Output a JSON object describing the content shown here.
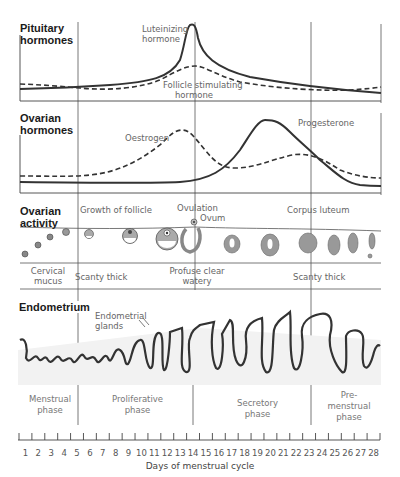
{
  "diagram": {
    "sections": {
      "pituitary": {
        "title_line1": "Pituitary",
        "title_line2": "hormones",
        "curves": [
          {
            "name": "Luteinizing hormone",
            "label_line1": "Luteinizing",
            "label_line2": "hormone",
            "style": "solid"
          },
          {
            "name": "Follicle stimulating hormone",
            "label_line1": "Follicle stimulating",
            "label_line2": "hormone",
            "style": "dashed"
          }
        ]
      },
      "ovarian_hormones": {
        "title_line1": "Ovarian",
        "title_line2": "hormones",
        "curves": [
          {
            "name": "Oestrogen",
            "label": "Oestrogen",
            "style": "dashed"
          },
          {
            "name": "Progesterone",
            "label": "Progesterone",
            "style": "solid"
          }
        ]
      },
      "ovarian_activity": {
        "title_line1": "Ovarian",
        "title_line2": "activity",
        "labels": {
          "growth": "Growth of follicle",
          "ovulation": "Ovulation",
          "ovum": "Ovum",
          "corpus_luteum": "Corpus luteum"
        },
        "cervical_mucus": {
          "label_line1": "Cervical",
          "label_line2": "mucus",
          "early": "Scanty thick",
          "mid_line1": "Profuse clear",
          "mid_line2": "watery",
          "late": "Scanty thick"
        }
      },
      "endometrium": {
        "title": "Endometrium",
        "glands_line1": "Endometrial",
        "glands_line2": "glands"
      }
    },
    "phases": [
      {
        "line1": "Menstrual",
        "line2": "phase",
        "line3": ""
      },
      {
        "line1": "Proliferative",
        "line2": "phase",
        "line3": ""
      },
      {
        "line1": "Secretory",
        "line2": "phase",
        "line3": ""
      },
      {
        "line1": "Pre-",
        "line2": "menstrual",
        "line3": "phase"
      }
    ],
    "axis": {
      "title": "Days of menstrual cycle",
      "days": [
        "1",
        "2",
        "3",
        "4",
        "5",
        "6",
        "7",
        "8",
        "9",
        "10",
        "11",
        "12",
        "13",
        "14",
        "15",
        "16",
        "17",
        "18",
        "19",
        "20",
        "21",
        "22",
        "23",
        "24",
        "25",
        "26",
        "27",
        "28"
      ]
    },
    "colors": {
      "line": "#333333",
      "grid": "#555555",
      "follicle_fill": "#9a9a9a",
      "endometrium_fill": "#eeeeee"
    }
  }
}
